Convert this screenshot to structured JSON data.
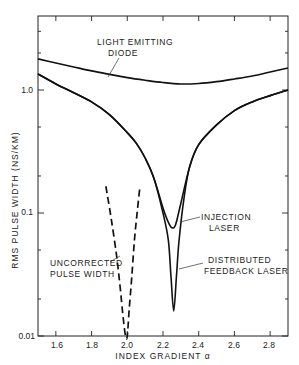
{
  "chart_data": {
    "type": "line",
    "title": "",
    "xlabel": "INDEX GRADIENT α",
    "ylabel": "RMS PULSE WIDTH (NS/KM)",
    "xscale": "linear",
    "yscale": "log",
    "xlim": [
      1.5,
      2.9
    ],
    "ylim": [
      0.01,
      4.0
    ],
    "grid": false,
    "x_ticks": [
      1.6,
      1.8,
      2.0,
      2.2,
      2.4,
      2.6,
      2.8
    ],
    "x_tick_labels": [
      "1.6",
      "1.8",
      "2.0",
      "2.2",
      "2.4",
      "2.6",
      "2.8"
    ],
    "y_tick_labels": [
      {
        "value": 0.01,
        "label": "0.01"
      },
      {
        "value": 0.1,
        "label": "0.1"
      },
      {
        "value": 1.0,
        "label": "1.0"
      }
    ],
    "series": [
      {
        "name": "Light Emitting Diode",
        "style": "solid",
        "x": [
          1.5,
          1.6,
          1.7,
          1.8,
          1.9,
          2.0,
          2.1,
          2.2,
          2.3,
          2.4,
          2.5,
          2.6,
          2.7,
          2.8,
          2.9
        ],
        "y": [
          1.79,
          1.66,
          1.54,
          1.43,
          1.34,
          1.26,
          1.2,
          1.15,
          1.12,
          1.13,
          1.17,
          1.23,
          1.3,
          1.4,
          1.51
        ]
      },
      {
        "name": "Injection Laser",
        "style": "solid",
        "x": [
          1.5,
          1.6,
          1.7,
          1.8,
          1.9,
          2.0,
          2.05,
          2.1,
          2.15,
          2.2,
          2.23,
          2.25,
          2.27,
          2.3,
          2.35,
          2.4,
          2.5,
          2.6,
          2.7,
          2.8,
          2.9
        ],
        "y": [
          1.35,
          1.12,
          0.95,
          0.8,
          0.63,
          0.45,
          0.37,
          0.28,
          0.19,
          0.11,
          0.084,
          0.076,
          0.08,
          0.12,
          0.24,
          0.36,
          0.52,
          0.68,
          0.8,
          0.9,
          1.0
        ]
      },
      {
        "name": "Distributed Feedback Laser",
        "style": "solid",
        "x": [
          1.5,
          1.6,
          1.7,
          1.8,
          1.9,
          2.0,
          2.05,
          2.1,
          2.15,
          2.2,
          2.23,
          2.245,
          2.26,
          2.275,
          2.29,
          2.32,
          2.35,
          2.4,
          2.5,
          2.6,
          2.7,
          2.8,
          2.9
        ],
        "y": [
          1.35,
          1.12,
          0.95,
          0.8,
          0.63,
          0.45,
          0.37,
          0.28,
          0.19,
          0.1,
          0.06,
          0.03,
          0.016,
          0.03,
          0.06,
          0.14,
          0.24,
          0.36,
          0.52,
          0.68,
          0.8,
          0.9,
          1.0
        ]
      },
      {
        "name": "Uncorrected Pulse Width",
        "style": "dashed",
        "x": [
          1.88,
          1.91,
          1.94,
          1.96,
          1.975,
          1.99,
          2.0,
          2.01,
          2.025,
          2.04,
          2.055,
          2.07
        ],
        "y": [
          0.165,
          0.09,
          0.045,
          0.025,
          0.015,
          0.01,
          0.01,
          0.016,
          0.03,
          0.06,
          0.1,
          0.16
        ]
      }
    ],
    "annotations": [
      {
        "text": [
          "LIGHT EMITTING",
          "DIODE"
        ],
        "points_to": "Light Emitting Diode"
      },
      {
        "text": [
          "INJECTION",
          "LASER"
        ],
        "points_to": "Injection Laser"
      },
      {
        "text": [
          "DISTRIBUTED",
          "FEEDBACK LASER"
        ],
        "points_to": "Distributed Feedback Laser"
      },
      {
        "text": [
          "UNCORRECTED",
          "PULSE WIDTH"
        ],
        "points_to": "Uncorrected Pulse Width"
      }
    ]
  },
  "labels": {
    "led_line1": "LIGHT EMITTING",
    "led_line2": "DIODE",
    "inj_line1": "INJECTION",
    "inj_line2": "LASER",
    "dfb_line1": "DISTRIBUTED",
    "dfb_line2": "FEEDBACK LASER",
    "unc_line1": "UNCORRECTED",
    "unc_line2": "PULSE WIDTH",
    "xlabel": "INDEX GRADIENT  α",
    "ylabel": "RMS  PULSE  WIDTH  (NS/KM)",
    "y_1": "1.0",
    "y_01": "0.1",
    "y_001": "0.01",
    "x_16": "1.6",
    "x_18": "1.8",
    "x_20": "2.0",
    "x_22": "2.2",
    "x_24": "2.4",
    "x_26": "2.6",
    "x_28": "2.8"
  }
}
